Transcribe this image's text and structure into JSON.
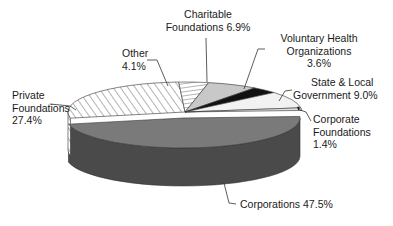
{
  "chart_data": {
    "type": "pie",
    "style": "3d-exploded-ellipse",
    "title": "",
    "unit": "%",
    "slices": [
      {
        "name": "Corporations",
        "value": 47.5,
        "fill": "#7a7a7a",
        "side": "#4a4a4a",
        "pattern": "solid"
      },
      {
        "name": "Private Foundations",
        "value": 27.4,
        "fill": "#ffffff",
        "side": "#ffffff",
        "pattern": "diagonal-hatch"
      },
      {
        "name": "Other",
        "value": 4.1,
        "fill": "#ffffff",
        "side": "#ffffff",
        "pattern": "horizontal-hatch"
      },
      {
        "name": "Charitable Foundations",
        "value": 6.9,
        "fill": "#c8c8c8",
        "side": "#9a9a9a",
        "pattern": "solid"
      },
      {
        "name": "Voluntary Health Organizations",
        "value": 3.6,
        "fill": "#111111",
        "side": "#111111",
        "pattern": "solid"
      },
      {
        "name": "State & Local Government",
        "value": 9.0,
        "fill": "#f2f2f2",
        "side": "#d0d0d0",
        "pattern": "solid"
      },
      {
        "name": "Corporate Foundations",
        "value": 1.4,
        "fill": "#e0e0e0",
        "side": "#888888",
        "pattern": "dotted"
      }
    ]
  },
  "labels": {
    "charitable": [
      "Charitable",
      "Foundations 6.9%"
    ],
    "voluntary": [
      "Voluntary Health",
      "Organizations",
      "3.6%"
    ],
    "state": [
      "State & Local",
      "Government 9.0%"
    ],
    "corporate_found": [
      "Corporate",
      "Foundations",
      "1.4%"
    ],
    "other": [
      "Other",
      "4.1%"
    ],
    "private": [
      "Private",
      "Foundations",
      "27.4%"
    ],
    "corporations": [
      "Corporations 47.5%"
    ]
  }
}
